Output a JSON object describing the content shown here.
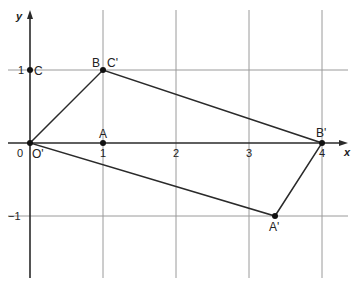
{
  "diagram": {
    "type": "coordinate-transformation",
    "axes": {
      "x_label": "x",
      "y_label": "y",
      "origin_label": "0",
      "x_ticks": [
        "1",
        "2",
        "3",
        "4"
      ],
      "y_ticks": [
        "1",
        "−1"
      ]
    },
    "points": [
      {
        "label": "O'",
        "x": 0,
        "y": 0
      },
      {
        "label": "A",
        "x": 1,
        "y": 0
      },
      {
        "label": "B",
        "x": 1,
        "y": 1
      },
      {
        "label": "C",
        "x": 0,
        "y": 1
      },
      {
        "label": "C'",
        "x": 1,
        "y": 1
      },
      {
        "label": "B'",
        "x": 4,
        "y": 0
      },
      {
        "label": "A'",
        "x": 3.35,
        "y": -1
      }
    ],
    "polygon": {
      "name": "O'C'B'A'",
      "vertices": [
        [
          0,
          0
        ],
        [
          1,
          1
        ],
        [
          4,
          0
        ],
        [
          3.35,
          -1
        ]
      ]
    },
    "colors": {
      "line": "#2a2a2a",
      "grid": "#8a8a8a",
      "background": "#ffffff"
    }
  }
}
